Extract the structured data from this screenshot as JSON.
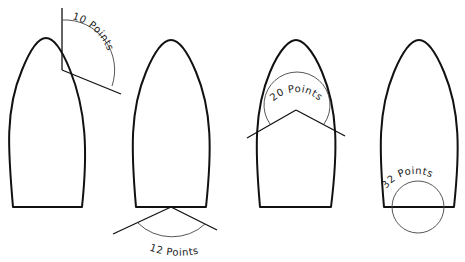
{
  "diagram": {
    "title": "",
    "colors": {
      "stroke": "#111111",
      "arc": "#444444",
      "background": "#ffffff"
    },
    "panels": [
      {
        "id": "boat-1",
        "label": "10 Points",
        "annotation": "angle-arc-at-side"
      },
      {
        "id": "boat-2",
        "label": "12 Points",
        "annotation": "angle-arc-at-stern"
      },
      {
        "id": "boat-3",
        "label": "20 Points",
        "annotation": "angle-arc-at-bow"
      },
      {
        "id": "boat-4",
        "label": "32 Points",
        "annotation": "full-circle-at-stern"
      }
    ]
  }
}
